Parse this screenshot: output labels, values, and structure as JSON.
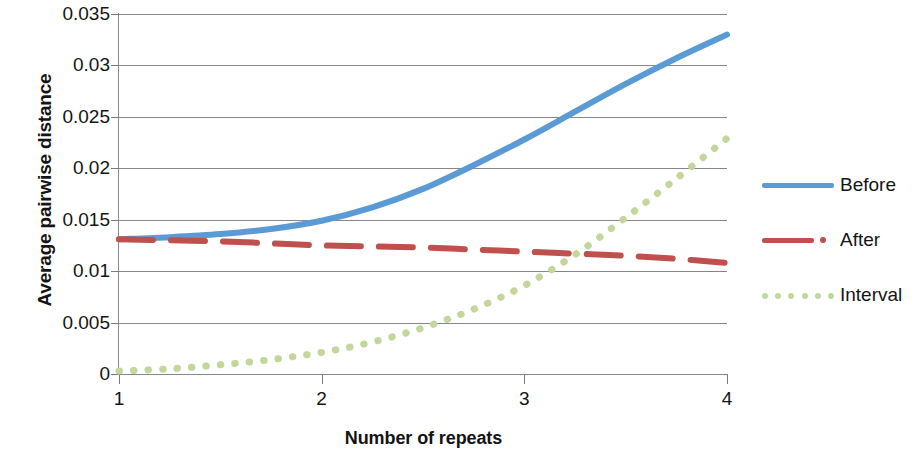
{
  "chart_data": {
    "type": "line",
    "title": "",
    "xlabel": "Number of repeats",
    "ylabel": "Average pairwise distance",
    "xlim": [
      1,
      4
    ],
    "ylim": [
      0,
      0.035
    ],
    "xticks": [
      "1",
      "2",
      "3",
      "4"
    ],
    "yticks": [
      "0",
      "0.005",
      "0.01",
      "0.015",
      "0.02",
      "0.025",
      "0.03",
      "0.035"
    ],
    "ytick_values": [
      0,
      0.005,
      0.01,
      0.015,
      0.02,
      0.025,
      0.03,
      0.035
    ],
    "grid": "horizontal",
    "legend_position": "right",
    "x": [
      1,
      1.25,
      1.5,
      1.75,
      2,
      2.25,
      2.5,
      2.75,
      3,
      3.25,
      3.5,
      3.75,
      4
    ],
    "series": [
      {
        "name": "Before",
        "color": "#5B9BD5",
        "style": "solid",
        "values": [
          0.0131,
          0.0133,
          0.0136,
          0.0141,
          0.0149,
          0.0162,
          0.018,
          0.0203,
          0.0228,
          0.0255,
          0.0282,
          0.0307,
          0.033
        ]
      },
      {
        "name": "After",
        "color": "#C0504D",
        "style": "dashed",
        "values": [
          0.0131,
          0.013,
          0.0129,
          0.0127,
          0.0125,
          0.0124,
          0.0123,
          0.0121,
          0.0119,
          0.0117,
          0.0115,
          0.0112,
          0.0108
        ]
      },
      {
        "name": "Interval",
        "color": "#C3D69B",
        "style": "dotted",
        "values": [
          0.0003,
          0.0005,
          0.0009,
          0.0014,
          0.0021,
          0.0031,
          0.0045,
          0.0063,
          0.0086,
          0.0116,
          0.0152,
          0.019,
          0.0229
        ]
      }
    ]
  },
  "legend": {
    "items": [
      {
        "label": "Before",
        "color": "#5B9BD5",
        "style": "solid"
      },
      {
        "label": "After",
        "color": "#C0504D",
        "style": "dashed"
      },
      {
        "label": "Interval",
        "color": "#C3D69B",
        "style": "dotted"
      }
    ]
  }
}
